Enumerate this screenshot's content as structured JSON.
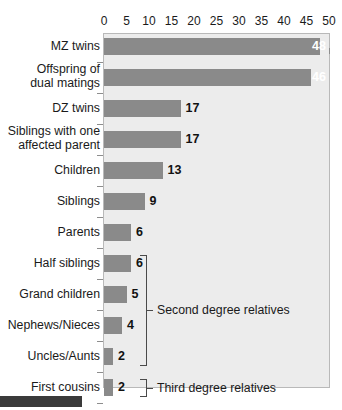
{
  "chart_data": {
    "type": "bar",
    "orientation": "horizontal",
    "title": "",
    "subtitle": "",
    "xlabel": "",
    "ylabel": "",
    "xlim": [
      0,
      50
    ],
    "xticks": [
      0,
      5,
      10,
      15,
      20,
      25,
      30,
      35,
      40,
      45,
      50
    ],
    "xtick_labels": [
      "0",
      "5",
      "10",
      "15",
      "20",
      "25",
      "30",
      "35",
      "40",
      "45",
      "50"
    ],
    "grid": false,
    "legend": null,
    "categories": [
      "MZ twins",
      "Offspring of\ndual matings",
      "DZ twins",
      "Siblings with one\naffected parent",
      "Children",
      "Siblings",
      "Parents",
      "Half siblings",
      "Grand children",
      "Nephews/Nieces",
      "Uncles/Aunts",
      "First cousins",
      "Baseline"
    ],
    "values": [
      48,
      46,
      17,
      17,
      13,
      9,
      6,
      6,
      5,
      4,
      2,
      2,
      1
    ],
    "value_labels": [
      "48",
      "46",
      "17",
      "17",
      "13",
      "9",
      "6",
      "6",
      "5",
      "4",
      "2",
      "2",
      "1"
    ],
    "annotations": [
      {
        "label": "Second degree relatives",
        "spans": [
          "Half siblings",
          "Grand children",
          "Nephews/Nieces",
          "Uncles/Aunts"
        ]
      },
      {
        "label": "Third degree relatives",
        "spans": [
          "First cousins"
        ]
      }
    ],
    "colors": {
      "bar": "#8a8a8a",
      "plot_background": "#ececec",
      "plot_border": "#b9b9b9",
      "text": "#1a1a1a",
      "bracket": "#4a4a4a",
      "page_background": "#ffffff",
      "footer_bar": "#3a3a3a"
    }
  }
}
